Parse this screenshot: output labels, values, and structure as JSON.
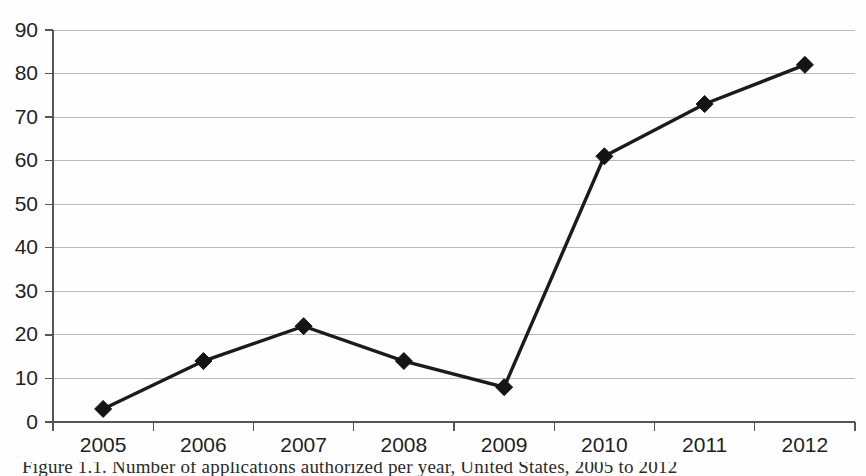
{
  "chart_data": {
    "type": "line",
    "title": "",
    "xlabel": "",
    "ylabel": "",
    "categories": [
      "2005",
      "2006",
      "2007",
      "2008",
      "2009",
      "2010",
      "2011",
      "2012"
    ],
    "values": [
      3,
      14,
      22,
      14,
      8,
      61,
      73,
      82
    ],
    "series": [
      {
        "name": "",
        "values": [
          3,
          14,
          22,
          14,
          8,
          61,
          73,
          82
        ]
      }
    ],
    "ylim": [
      0,
      90
    ],
    "ytick_values": [
      0,
      10,
      20,
      30,
      40,
      50,
      60,
      70,
      80,
      90
    ],
    "ytick_labels": [
      "0",
      "10",
      "20",
      "30",
      "40",
      "50",
      "60",
      "70",
      "80",
      "90"
    ],
    "xtick_labels": [
      "2005",
      "2006",
      "2007",
      "2008",
      "2009",
      "2010",
      "2011",
      "2012"
    ],
    "grid": true,
    "grid_axis": "y",
    "legend": false,
    "legend_position": "none",
    "marker": "diamond",
    "line_color": "#1b1b1b",
    "grid_color": "#b9b9b9",
    "axis_color": "#555555",
    "background_color": "#ffffff"
  },
  "caption": {
    "text": "Figure 1.1. Number of applications authorized per year, United States, 2005 to 2012"
  }
}
